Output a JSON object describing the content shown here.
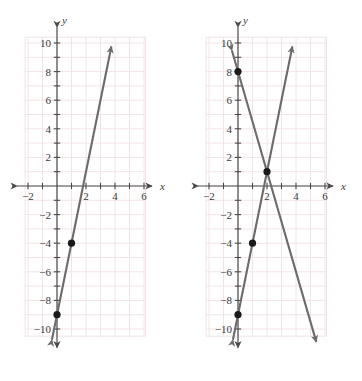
{
  "figure": {
    "panel_count": 2,
    "background_color": "#ffffff",
    "grid_color": "#f2e4e6",
    "axis_color": "#4a4a4a",
    "line_color": "#6b6b6b",
    "point_color": "#1a1a1a"
  },
  "chart_data": [
    {
      "type": "line",
      "panel": "left",
      "title": "",
      "xlabel": "x",
      "ylabel": "y",
      "xlim": [
        -2.6,
        6.8
      ],
      "ylim": [
        -11.2,
        11.0
      ],
      "grid": true,
      "grid_step": 1,
      "legend": "none",
      "x_ticks": [
        -2,
        2,
        4,
        6
      ],
      "x_tick_labels": [
        "-2",
        "2",
        "4",
        "6"
      ],
      "y_ticks": [
        -10,
        -8,
        -6,
        -4,
        -2,
        2,
        4,
        6,
        8,
        10
      ],
      "y_tick_labels": [
        "-10",
        "-8",
        "-6",
        "-4",
        "-2",
        "2",
        "4",
        "6",
        "8",
        "10"
      ],
      "series": [
        {
          "name": "line-1",
          "equation": "y = 5x - 9",
          "slope": 5,
          "intercept": -9,
          "x_start": -0.35,
          "x_end": 3.75,
          "arrow_start": true,
          "arrow_end": true
        }
      ],
      "points": [
        {
          "x": 0,
          "y": -9,
          "label": "(0, -9)"
        },
        {
          "x": 1,
          "y": -4,
          "label": "(1, -4)"
        }
      ]
    },
    {
      "type": "line",
      "panel": "right",
      "title": "",
      "xlabel": "x",
      "ylabel": "y",
      "xlim": [
        -2.6,
        6.8
      ],
      "ylim": [
        -11.2,
        11.0
      ],
      "grid": true,
      "grid_step": 1,
      "legend": "none",
      "x_ticks": [
        -2,
        2,
        4,
        6
      ],
      "x_tick_labels": [
        "-2",
        "2",
        "4",
        "6"
      ],
      "y_ticks": [
        -10,
        -8,
        -6,
        -4,
        -2,
        2,
        4,
        6,
        8,
        10
      ],
      "y_tick_labels": [
        "-10",
        "-8",
        "-6",
        "-4",
        "-2",
        "2",
        "4",
        "6",
        "8",
        "10"
      ],
      "series": [
        {
          "name": "line-1",
          "equation": "y = 5x - 9",
          "slope": 5,
          "intercept": -9,
          "x_start": -0.35,
          "x_end": 3.75,
          "arrow_start": true,
          "arrow_end": true
        },
        {
          "name": "line-2",
          "equation": "y = -3.5x + 8",
          "slope": -3.5,
          "intercept": 8,
          "x_start": -0.42,
          "x_end": 5.4,
          "arrow_start": true,
          "arrow_end": true
        }
      ],
      "points": [
        {
          "x": 0,
          "y": 8,
          "label": "(0, 8)"
        },
        {
          "x": 1,
          "y": -4,
          "label": "(1, -4)"
        },
        {
          "x": 0,
          "y": -9,
          "label": "(0, -9)"
        },
        {
          "x": 2,
          "y": 1,
          "label": "(2, 1) intersection"
        }
      ],
      "intersection": {
        "x": 2,
        "y": 1
      }
    }
  ]
}
